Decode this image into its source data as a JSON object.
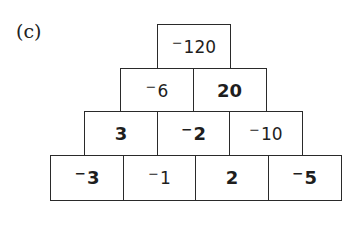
{
  "label": "(c)",
  "pyramid": {
    "rows": [
      [
        {
          "sign": "−",
          "value": "120",
          "bold": false
        }
      ],
      [
        {
          "sign": "−",
          "value": "6",
          "bold": false
        },
        {
          "sign": "",
          "value": "20",
          "bold": true
        }
      ],
      [
        {
          "sign": "",
          "value": "3",
          "bold": true
        },
        {
          "sign": "−",
          "value": "2",
          "bold": true
        },
        {
          "sign": "−",
          "value": "10",
          "bold": false
        }
      ],
      [
        {
          "sign": "−",
          "value": "3",
          "bold": true
        },
        {
          "sign": "−",
          "value": "1",
          "bold": false
        },
        {
          "sign": "",
          "value": "2",
          "bold": true
        },
        {
          "sign": "−",
          "value": "5",
          "bold": true
        }
      ]
    ]
  }
}
